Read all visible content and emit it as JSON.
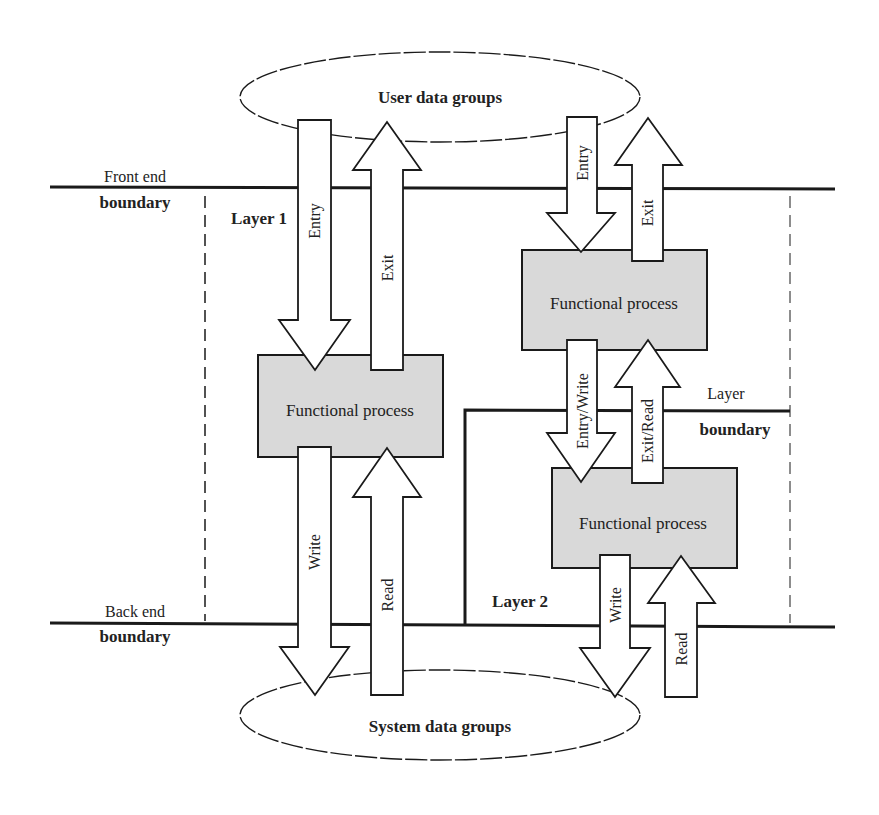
{
  "diagram": {
    "type": "COSMIC functional size measurement layer diagram",
    "data_stores": {
      "user": {
        "label": "User data groups"
      },
      "system": {
        "label": "System data groups"
      }
    },
    "boundaries": {
      "front_end": {
        "line1": "Front end",
        "line2": "boundary"
      },
      "back_end": {
        "line1": "Back end",
        "line2": "boundary"
      },
      "layer": {
        "line1": "Layer",
        "line2": "boundary"
      }
    },
    "layers": {
      "layer1": {
        "label": "Layer 1"
      },
      "layer2": {
        "label": "Layer 2"
      }
    },
    "processes": [
      {
        "id": "fp-layer1",
        "label": "Functional process"
      },
      {
        "id": "fp-layer2-upper",
        "label": "Functional process"
      },
      {
        "id": "fp-layer2-lower",
        "label": "Functional process"
      }
    ],
    "arrows": {
      "l1_entry": "Entry",
      "l1_exit": "Exit",
      "l1_write": "Write",
      "l1_read": "Read",
      "l2_entry": "Entry",
      "l2_exit": "Exit",
      "l2_entry_write": "Entry/Write",
      "l2_exit_read": "Exit/Read",
      "l2_write": "Write",
      "l2_read": "Read"
    },
    "colors": {
      "line": "#1a1a1a",
      "process_fill": "#d9d9d9",
      "arrow_fill": "#ffffff",
      "background": "#ffffff"
    }
  }
}
